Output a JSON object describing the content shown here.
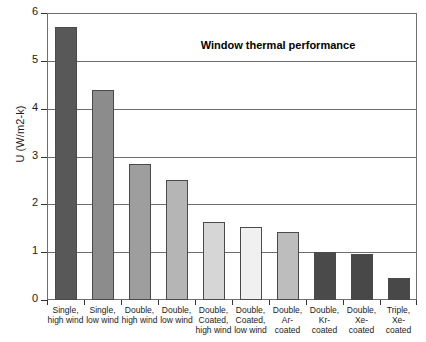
{
  "chart_data": {
    "type": "bar",
    "title": "Window thermal performance",
    "xlabel": "",
    "ylabel": "U (W/m2-k)",
    "ylim": [
      0,
      6
    ],
    "yticks": [
      0,
      1,
      2,
      3,
      4,
      5,
      6
    ],
    "grid": true,
    "legend": false,
    "categories": [
      "Single, high wind",
      "Single, low wind",
      "Double, high wind",
      "Double, low wind",
      "Double, Coated, high wind",
      "Double, Coated, low wind",
      "Double, Ar-coated",
      "Double, Kr-coated",
      "Double, Xe-coated",
      "Triple, Xe-coated"
    ],
    "category_lines": [
      [
        "Single,",
        "high wind"
      ],
      [
        "Single,",
        "low wind"
      ],
      [
        "Double,",
        "high wind"
      ],
      [
        "Double,",
        "low wind"
      ],
      [
        "Double,",
        "Coated,",
        "high wind"
      ],
      [
        "Double,",
        "Coated,",
        "low wind"
      ],
      [
        "Double,",
        "Ar-",
        "coated"
      ],
      [
        "Double,",
        "Kr-",
        "coated"
      ],
      [
        "Double,",
        "Xe-",
        "coated"
      ],
      [
        "Triple,",
        "Xe-",
        "coated"
      ]
    ],
    "values": [
      5.7,
      4.4,
      2.85,
      2.5,
      1.63,
      1.53,
      1.43,
      1.0,
      0.96,
      0.46
    ],
    "bar_colors": [
      "#585858",
      "#8c8c8c",
      "#9e9e9e",
      "#b5b5b5",
      "#d6d6d6",
      "#f0f0f0",
      "#bdbdbd",
      "#4a4a4a",
      "#484848",
      "#484848"
    ],
    "bar_edge_color": "#4a4a4a",
    "axis_color": "#6e6e6e",
    "background_color": "#ffffff"
  }
}
